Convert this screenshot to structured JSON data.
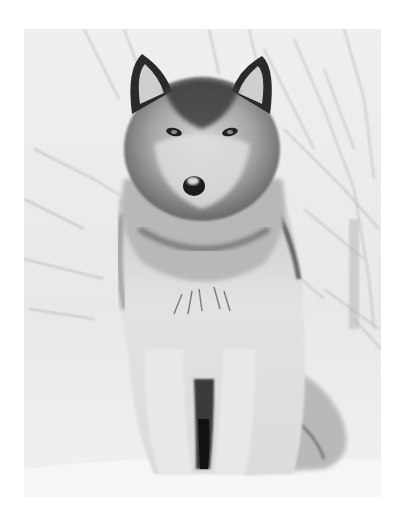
{
  "image": {
    "subject": "Gray wolf sitting in snow",
    "style": "black-and-white photograph",
    "background": "snowy forest with bare branches",
    "border_color": "#ffffff",
    "snow_color": "#f2f2f2",
    "fur_dark_color": "#2a2a2a",
    "fur_mid_color": "#8a8a8a",
    "fur_light_color": "#e4e4e4"
  }
}
